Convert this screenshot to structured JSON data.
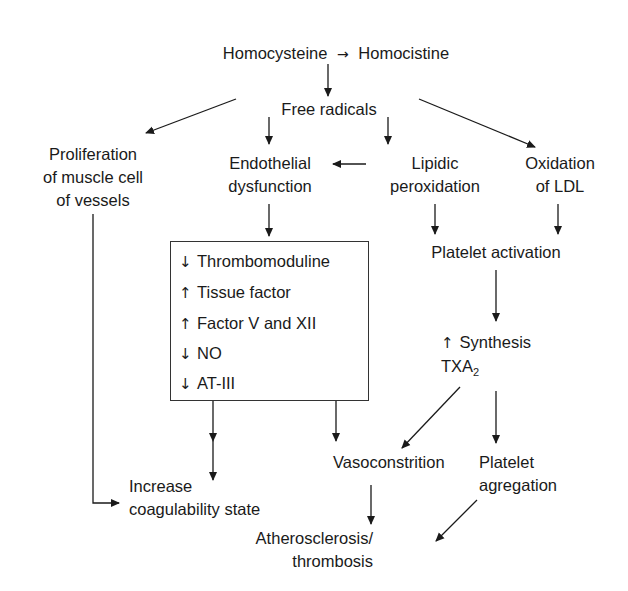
{
  "diagram": {
    "title_row": {
      "source": "Homocysteine",
      "arrow": "→",
      "target": "Homocistine"
    },
    "nodes": {
      "free_radicals": "Free radicals",
      "proliferation": [
        "Proliferation",
        "of muscle cell",
        "of vessels"
      ],
      "endothelial": [
        "Endothelial",
        "dysfunction"
      ],
      "lipidic": [
        "Lipidic",
        "peroxidation"
      ],
      "oxidation_ldl": [
        "Oxidation",
        "of LDL"
      ],
      "platelet_activation": "Platelet activation",
      "synthesis": {
        "arrow": "↑",
        "line1": "Synthesis",
        "line2_main": "TXA",
        "line2_sub": "2"
      },
      "vasoconstriction": "Vasoconstrition",
      "platelet_aggregation": [
        "Platelet",
        "agregation"
      ],
      "increase_coag": [
        "Increase",
        "coagulability state"
      ],
      "atherosclerosis": [
        "Atherosclerosis/",
        "thrombosis"
      ]
    },
    "effects_box": [
      {
        "symbol": "↓",
        "label": "Thrombomoduline"
      },
      {
        "symbol": "↑",
        "label": "Tissue factor"
      },
      {
        "symbol": "↑",
        "label": "Factor V and XII"
      },
      {
        "symbol": "↓",
        "label": "NO"
      },
      {
        "symbol": "↓",
        "label": "AT-III"
      }
    ],
    "colors": {
      "line": "#1a1a1a",
      "text": "#1a1a1a",
      "background": "#ffffff"
    }
  }
}
